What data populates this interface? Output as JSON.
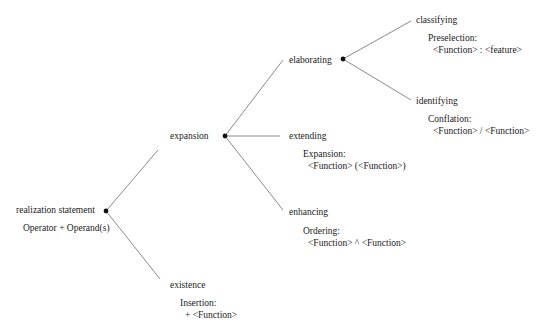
{
  "diagram": {
    "root": {
      "label": "realization statement",
      "note": "Operator + Operand(s)"
    },
    "level1": {
      "expansion": {
        "label": "expansion"
      },
      "existence": {
        "label": "existence",
        "note_title": "Insertion:",
        "note_body": "+ <Function>"
      }
    },
    "level2": {
      "elaborating": {
        "label": "elaborating"
      },
      "extending": {
        "label": "extending",
        "note_title": "Expansion:",
        "note_body": "<Function> (<Function>)"
      },
      "enhancing": {
        "label": "enhancing",
        "note_title": "Ordering:",
        "note_body": "<Function> ^ <Function>"
      }
    },
    "level3": {
      "classifying": {
        "label": "classifying",
        "note_title": "Preselection:",
        "note_body": "<Function> : <feature>"
      },
      "identifying": {
        "label": "identifying",
        "note_title": "Conflation:",
        "note_body": "<Function> / <Function>"
      }
    },
    "colors": {
      "line": "#8a8a8a",
      "node": "#111111",
      "text": "#1a1a1a"
    }
  }
}
